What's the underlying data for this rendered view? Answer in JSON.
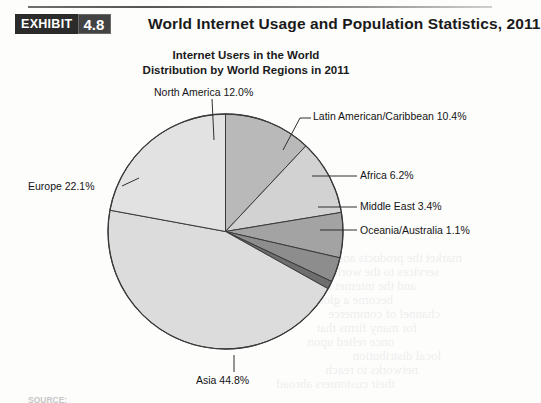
{
  "exhibit": {
    "badge_word": "EXHIBIT",
    "badge_number": "4.8",
    "title": "World Internet Usage and Population Statistics, 2011"
  },
  "chart_title": {
    "line1": "Internet Users in the World",
    "line2": "Distribution by World Regions in 2011"
  },
  "source": {
    "text": "SOURCE:"
  },
  "labels": {
    "north_america": "North America 12.0%",
    "europe": "Europe 22.1%",
    "latin_america": "Latin American/Caribbean 10.4%",
    "africa": "Africa 6.2%",
    "middle_east": "Middle East 3.4%",
    "oceania": "Oceania/Australia 1.1%",
    "asia": "Asia 44.8%"
  },
  "chart_data": {
    "type": "pie",
    "title": "Internet Users in the World Distribution by World Regions in 2011",
    "unit": "percent",
    "start_angle_deg": 0,
    "direction": "clockwise",
    "legend": "none-labels-with-leader-lines",
    "categories": [
      "North America",
      "Latin American/Caribbean",
      "Africa",
      "Middle East",
      "Oceania/Australia",
      "Asia",
      "Europe"
    ],
    "values": [
      12.0,
      10.4,
      6.2,
      3.4,
      1.1,
      44.8,
      22.1
    ],
    "slices": [
      {
        "label": "North America",
        "value": 12.0,
        "color": "#b9b9b9"
      },
      {
        "label": "Latin American/Caribbean",
        "value": 10.4,
        "color": "#d2d2d2"
      },
      {
        "label": "Africa",
        "value": 6.2,
        "color": "#a3a3a3"
      },
      {
        "label": "Middle East",
        "value": 3.4,
        "color": "#8d8d8d"
      },
      {
        "label": "Oceania/Australia",
        "value": 1.1,
        "color": "#6e6e6e"
      },
      {
        "label": "Asia",
        "value": 44.8,
        "color": "#dcdcdc"
      },
      {
        "label": "Europe",
        "value": 22.1,
        "color": "#e2e2e2"
      }
    ],
    "total": 100.0,
    "stroke_color": "#3a3a3a"
  },
  "bleed_through": {
    "lines": [
      "market the products and",
      "services to the world",
      "and the internet has",
      "become a global",
      "channel of commerce",
      "for many firms that",
      "once relied upon",
      "local distribution",
      "networks to reach",
      "their customers abroad"
    ]
  }
}
